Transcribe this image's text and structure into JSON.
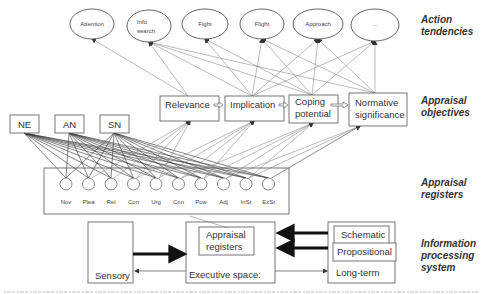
{
  "action_tendencies": {
    "label_line1": "Action",
    "label_line2": "tendencies",
    "items": [
      {
        "line1": "Attention",
        "line2": ""
      },
      {
        "line1": "Info",
        "line2": "search"
      },
      {
        "line1": "Fight",
        "line2": ""
      },
      {
        "line1": "Flight",
        "line2": ""
      },
      {
        "line1": "Approach",
        "line2": ""
      },
      {
        "line1": "...",
        "line2": ""
      }
    ]
  },
  "appraisal_objectives": {
    "label_line1": "Appraisal",
    "label_line2": "objectives",
    "items": [
      {
        "line1": "Relevance",
        "line2": ""
      },
      {
        "line1": "Implication",
        "line2": ""
      },
      {
        "line1": "Coping",
        "line2": "potential"
      },
      {
        "line1": "Normative",
        "line2": "significance"
      }
    ]
  },
  "sources": [
    "NE",
    "AN",
    "SN"
  ],
  "appraisal_registers": {
    "label_line1": "Appraisal",
    "label_line2": "registers",
    "items": [
      "Nov",
      "Plea",
      "Rel",
      "Con",
      "Urg",
      "Con",
      "Pow",
      "Adj",
      "InSt",
      "ExSt"
    ]
  },
  "information_processing": {
    "label_line1": "Information",
    "label_line2": "processing",
    "label_line3": "system",
    "sensory": "Sensory",
    "executive_space": "Executive space:",
    "executive_registers_line1": "Appraisal",
    "executive_registers_line2": "registers",
    "long_term": "Long-term",
    "schematic": "Schematic",
    "propositional": "Propositional"
  },
  "caption": {
    "text_clipped": true
  }
}
